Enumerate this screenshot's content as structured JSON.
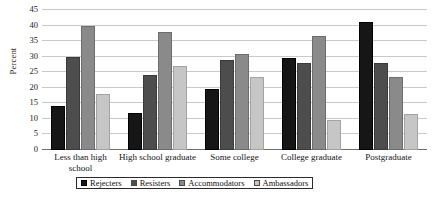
{
  "chart_data": {
    "type": "bar",
    "title": "",
    "subtitle": "",
    "xlabel": "",
    "ylabel": "Percent",
    "ylim": [
      0,
      45
    ],
    "ytick_step": 5,
    "yticks": [
      0,
      5,
      10,
      15,
      20,
      25,
      30,
      35,
      40,
      45
    ],
    "ytick_labels": [
      "0",
      "5",
      "10",
      "15",
      "20",
      "25",
      "30",
      "35",
      "40",
      "45"
    ],
    "grid": true,
    "grid_axis": "y",
    "legend_position": "bottom",
    "orientation": "vertical",
    "grouping": "clustered",
    "categories": [
      "Less than high school",
      "High school graduate",
      "Some college",
      "College graduate",
      "Postgraduate"
    ],
    "series": [
      {
        "name": "Rejecters",
        "color": "#161616",
        "values": [
          14,
          12,
          19.5,
          29.5,
          41
        ]
      },
      {
        "name": "Resisters",
        "color": "#4d4d4d",
        "values": [
          30,
          24,
          29,
          28,
          28
        ]
      },
      {
        "name": "Accommodators",
        "color": "#8a8a8a",
        "values": [
          40,
          38,
          31,
          36.5,
          23.5
        ]
      },
      {
        "name": "Ambassadors",
        "color": "#c6c6c6",
        "values": [
          18,
          27,
          23.5,
          9.5,
          11.5
        ]
      }
    ],
    "annotations": []
  },
  "axis": {
    "y_title": "Percent"
  },
  "colors": {
    "gridline": "#c9c9c9",
    "baseline": "#6e6e6e",
    "text": "#111111",
    "background": "#ffffff"
  }
}
